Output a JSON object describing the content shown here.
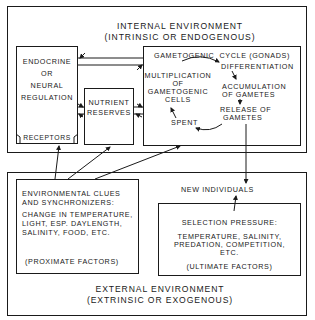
{
  "internal_environment": {
    "title": "INTERNAL ENVIRONMENT",
    "subtitle": "(INTRINSIC OR ENDOGENOUS)",
    "endocrine": {
      "line1": "ENDOCRINE",
      "line2": "OR",
      "line3": "NEURAL",
      "line4": "REGULATION",
      "receptors": "RECEPTORS"
    },
    "nutrient": {
      "line1": "NUTRIENT",
      "line2": "RESERVES"
    },
    "gametogenic": {
      "title": "GAMETOGENIC  CYCLE (GONADS)",
      "differentiation": "DIFFERENTIATION",
      "multiplication": [
        "MULTIPLICATION",
        "OF",
        "GAMETOGENIC",
        "CELLS"
      ],
      "accumulation": [
        "ACCUMULATION",
        "OF GAMETES"
      ],
      "release": [
        "RELEASE OF",
        "GAMETES"
      ],
      "spent": "SPENT"
    }
  },
  "external_environment": {
    "title": "EXTERNAL ENVIRONMENT",
    "subtitle": "(EXTRINSIC OR EXOGENOUS)",
    "clues": {
      "heading1": "ENVIRONMENTAL CLUES",
      "heading2": "AND SYNCHRONIZERS:",
      "body1": "CHANGE IN TEMPERATURE,",
      "body2": "LIGHT, ESP. DAYLENGTH,",
      "body3": "SALINITY, FOOD, ETC.",
      "footer": "(PROXIMATE FACTORS)"
    },
    "new_individuals": "NEW INDIVIDUALS",
    "selection": {
      "heading": "SELECTION PRESSURE:",
      "body1": "TEMPERATURE, SALINITY,",
      "body2": "PREDATION, COMPETITION,",
      "body3": "ETC.",
      "footer": "(ULTIMATE FACTORS)"
    }
  }
}
